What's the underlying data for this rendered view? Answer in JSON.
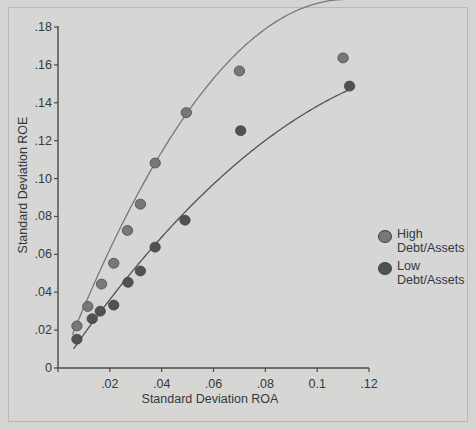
{
  "chart_data": {
    "type": "scatter",
    "title": "",
    "xlabel": "Standard Deviation ROA",
    "ylabel": "Standard Deviation ROE",
    "xlim": [
      0,
      0.12
    ],
    "ylim": [
      0,
      0.18
    ],
    "xticks": [
      0,
      0.02,
      0.04,
      0.06,
      0.08,
      0.1,
      0.12
    ],
    "xticklabels": [
      "",
      ".02",
      ".04",
      ".06",
      ".08",
      "0.1",
      ".12"
    ],
    "yticks": [
      0,
      0.02,
      0.04,
      0.06,
      0.08,
      0.1,
      0.12,
      0.14,
      0.16,
      0.18
    ],
    "yticklabels": [
      "0",
      ".02",
      ".04",
      ".06",
      ".08",
      ".10",
      ".12",
      ".14",
      ".16",
      ".18"
    ],
    "grid": false,
    "legend_position": "right",
    "series": [
      {
        "name": "High Debt/Assets",
        "color": "#78787a",
        "marker": "circle",
        "points": [
          {
            "x": 0.0073,
            "y": 0.0222
          },
          {
            "x": 0.0115,
            "y": 0.0325
          },
          {
            "x": 0.0168,
            "y": 0.0443
          },
          {
            "x": 0.0215,
            "y": 0.0553
          },
          {
            "x": 0.0268,
            "y": 0.0726
          },
          {
            "x": 0.0318,
            "y": 0.0865
          },
          {
            "x": 0.0375,
            "y": 0.1082
          },
          {
            "x": 0.0495,
            "y": 0.1348
          },
          {
            "x": 0.07,
            "y": 0.1568
          },
          {
            "x": 0.11,
            "y": 0.1637
          }
        ],
        "fit": {
          "type": "quadratic",
          "a": -15.8,
          "b": 3.52,
          "c": -0.0015,
          "x_start": 0.0055,
          "x_end": 0.111
        }
      },
      {
        "name": "Low Debt/Assets",
        "color": "#4e5257",
        "marker": "circle",
        "points": [
          {
            "x": 0.0073,
            "y": 0.0152
          },
          {
            "x": 0.0132,
            "y": 0.026
          },
          {
            "x": 0.0163,
            "y": 0.03
          },
          {
            "x": 0.0215,
            "y": 0.0332
          },
          {
            "x": 0.027,
            "y": 0.0452
          },
          {
            "x": 0.0318,
            "y": 0.0512
          },
          {
            "x": 0.0375,
            "y": 0.0638
          },
          {
            "x": 0.049,
            "y": 0.078
          },
          {
            "x": 0.0705,
            "y": 0.1253
          },
          {
            "x": 0.1125,
            "y": 0.1488
          }
        ],
        "fit": {
          "type": "quadratic",
          "a": -6.2,
          "b": 2.02,
          "c": -0.0018,
          "x_start": 0.006,
          "x_end": 0.1135
        }
      }
    ]
  },
  "legend": {
    "items": [
      {
        "label": "High\nDebt/Assets",
        "color": "#78787a"
      },
      {
        "label": "Low\nDebt/Assets",
        "color": "#4e5257"
      }
    ]
  },
  "colors": {
    "background": "#d6d6d4",
    "frame": "#b8b8b6",
    "axis": "#4a4a4a",
    "text": "#33393e",
    "series_high": "#78787a",
    "series_low": "#4e5257"
  }
}
